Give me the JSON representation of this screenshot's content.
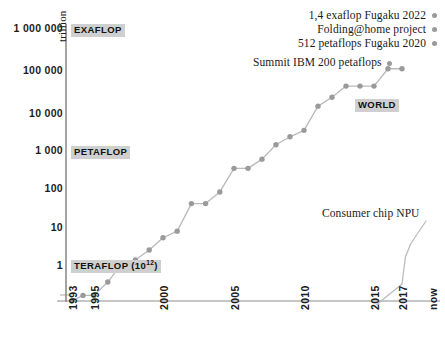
{
  "chart_data": {
    "type": "line",
    "title": "",
    "subtitle": "",
    "xlabel": "",
    "ylabel": "trillion",
    "scale": "log",
    "grid": false,
    "legend_position": "top-right",
    "xlim": [
      1993,
      2024
    ],
    "ylim": [
      0.1,
      2000000
    ],
    "x_tick_labels": [
      "1993",
      "1995",
      "2000",
      "2005",
      "2010",
      "2015",
      "2017",
      "now"
    ],
    "x_tick_values": [
      1993,
      1995,
      2000,
      2005,
      2010,
      2015,
      2017,
      2024
    ],
    "y_tick_labels": [
      "1 000 000",
      "100 000",
      "10 000",
      "1 000",
      "100",
      "10",
      "1"
    ],
    "y_tick_values": [
      1000000,
      100000,
      10000,
      1000,
      100,
      10,
      1
    ],
    "series": [
      {
        "name": "World fastest supercomputer",
        "marker": "circle",
        "color": "#9a9a9a",
        "points": [
          {
            "x": 1993,
            "y": 0.124
          },
          {
            "x": 1994,
            "y": 0.17
          },
          {
            "x": 1995,
            "y": 0.17
          },
          {
            "x": 1996,
            "y": 0.37
          },
          {
            "x": 1997,
            "y": 1.07
          },
          {
            "x": 1998,
            "y": 1.34
          },
          {
            "x": 1999,
            "y": 2.4
          },
          {
            "x": 2000,
            "y": 4.9
          },
          {
            "x": 2001,
            "y": 7.2
          },
          {
            "x": 2002,
            "y": 35.8
          },
          {
            "x": 2003,
            "y": 35.8
          },
          {
            "x": 2004,
            "y": 70.7
          },
          {
            "x": 2005,
            "y": 280
          },
          {
            "x": 2006,
            "y": 280
          },
          {
            "x": 2007,
            "y": 478
          },
          {
            "x": 2008,
            "y": 1105
          },
          {
            "x": 2009,
            "y": 1759
          },
          {
            "x": 2010,
            "y": 2566
          },
          {
            "x": 2011,
            "y": 10510
          },
          {
            "x": 2012,
            "y": 17590
          },
          {
            "x": 2013,
            "y": 33860
          },
          {
            "x": 2014,
            "y": 33860
          },
          {
            "x": 2015,
            "y": 33860
          },
          {
            "x": 2016,
            "y": 93000
          },
          {
            "x": 2017,
            "y": 93000
          }
        ]
      },
      {
        "name": "Consumer chip NPU",
        "marker": "none",
        "color": "#a9a9a9",
        "points": [
          {
            "x": 2015.2,
            "y": 0.1
          },
          {
            "x": 2017.0,
            "y": 0.33
          },
          {
            "x": 2017.8,
            "y": 1.6
          },
          {
            "x": 2019.0,
            "y": 3.4
          },
          {
            "x": 2022.6,
            "y": 13.0
          }
        ]
      }
    ],
    "annotations": [
      {
        "id": "anno-exaflop-fugaku",
        "text": "1,4 exaflop Fugaku 2022",
        "dot": true
      },
      {
        "id": "anno-folding-home",
        "text": "Folding@home project",
        "dot": true
      },
      {
        "id": "anno-petaflops-fugaku",
        "text": "512 petaflops Fugaku 2020",
        "dot": true
      },
      {
        "id": "anno-summit",
        "text": "Summit IBM 200 petaflops",
        "dot": true
      },
      {
        "id": "anno-consumer-npu",
        "text": "Consumer chip NPU",
        "dot": false
      }
    ],
    "band_labels": [
      {
        "id": "band-exaflop",
        "text": "EXAFLOP",
        "value": 1000000
      },
      {
        "id": "band-petaflop",
        "text": "PETAFLOP",
        "value": 1000
      },
      {
        "id": "band-teraflop",
        "text": "TERAFLOP (10",
        "sup": "12",
        "suffix": ")",
        "value": 1
      },
      {
        "id": "band-world",
        "text": "WORLD",
        "value": 20000
      }
    ],
    "colors": {
      "marker": "#9a9a9a",
      "line": "#b3b3b3",
      "axis": "#8d8d8d",
      "highlight_bg": "#cfcfcf",
      "text": "#1a1a1a"
    }
  },
  "axis": {
    "y_caption": "trillion"
  },
  "y_ticks": [
    {
      "label": "1 000 000",
      "top": 28
    },
    {
      "label": "100 000",
      "top": 70
    },
    {
      "label": "10 000",
      "top": 113
    },
    {
      "label": "1 000",
      "top": 150
    },
    {
      "label": "100",
      "top": 188
    },
    {
      "label": "10",
      "top": 227
    },
    {
      "label": "1",
      "top": 265
    }
  ],
  "x_ticks": [
    {
      "label": "1993",
      "left": 68
    },
    {
      "label": "1995",
      "left": 90
    },
    {
      "label": "2000",
      "left": 159
    },
    {
      "label": "2005",
      "left": 230
    },
    {
      "label": "2010",
      "left": 300
    },
    {
      "label": "2015",
      "left": 370
    },
    {
      "label": "2017",
      "left": 398
    },
    {
      "label": "now",
      "left": 428
    }
  ],
  "band_labels": {
    "exaflop": "EXAFLOP",
    "petaflop": "PETAFLOP",
    "teraflop_main": "TERAFLOP (10",
    "teraflop_sup": "12",
    "teraflop_tail": ")",
    "world": "WORLD"
  },
  "annotations_top": [
    {
      "text": "1,4 exaflop Fugaku 2022"
    },
    {
      "text": "Folding@home project"
    },
    {
      "text": "512 petaflops Fugaku 2020"
    }
  ],
  "annotation_summit": "Summit IBM 200 petaflops",
  "annotation_npu": "Consumer chip NPU"
}
